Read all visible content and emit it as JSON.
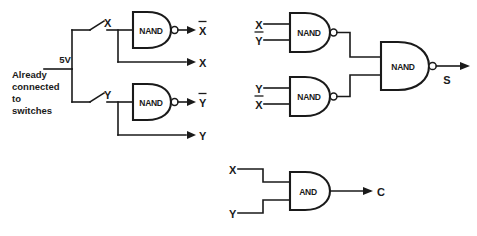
{
  "diagram": {
    "type": "logic-circuit-schematic",
    "background_color": "#ffffff",
    "ink_color": "#1a1a1a"
  },
  "supply": {
    "voltage_label": "5V",
    "note_lines": [
      "Already",
      "connected",
      "to",
      "switches"
    ]
  },
  "switches": [
    {
      "name": "switch-x",
      "label": "X",
      "state": "open"
    },
    {
      "name": "switch-y",
      "label": "Y",
      "state": "open"
    }
  ],
  "gates": [
    {
      "id": "nand-x-inverter",
      "type": "NAND",
      "label": "NAND",
      "inputs": [
        "X",
        "X"
      ],
      "output": "X̄",
      "bubble": true
    },
    {
      "id": "nand-y-inverter",
      "type": "NAND",
      "label": "NAND",
      "inputs": [
        "Y",
        "Y"
      ],
      "output": "Ȳ",
      "bubble": true
    },
    {
      "id": "nand-x-ybar",
      "type": "NAND",
      "label": "NAND",
      "inputs": [
        "X",
        "Ȳ"
      ],
      "output": "",
      "bubble": true
    },
    {
      "id": "nand-y-xbar",
      "type": "NAND",
      "label": "NAND",
      "inputs": [
        "Y",
        "X̄"
      ],
      "output": "",
      "bubble": true
    },
    {
      "id": "nand-sum",
      "type": "NAND",
      "label": "NAND",
      "inputs": [],
      "output": "S",
      "bubble": true
    },
    {
      "id": "and-carry",
      "type": "AND",
      "label": "AND",
      "inputs": [
        "X",
        "Y"
      ],
      "output": "C",
      "bubble": false
    }
  ],
  "labels": {
    "buffer_x_top_in": "X",
    "buffer_y_top_in": "Y",
    "out_xbar": "X",
    "out_xbar_has_overline": true,
    "out_x": "X",
    "out_ybar": "Y",
    "out_ybar_has_overline": true,
    "out_y": "Y",
    "sum_in_x": "X",
    "sum_in_ybar": "Y",
    "sum_in_y": "Y",
    "sum_in_xbar": "X",
    "sum_out": "S",
    "carry_in_x": "X",
    "carry_in_y": "Y",
    "carry_out": "C"
  }
}
